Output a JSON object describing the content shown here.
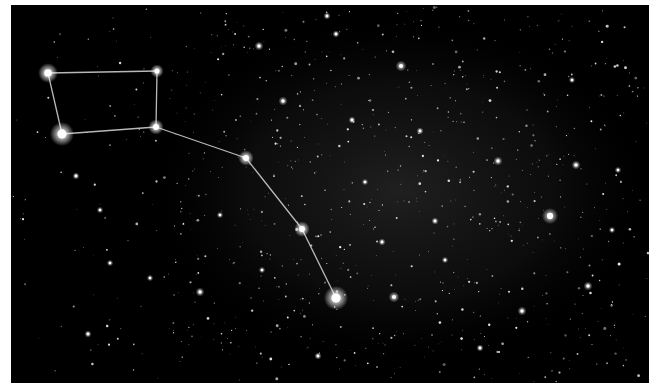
{
  "image": {
    "subject": "Big Dipper constellation star field",
    "background": "#000000",
    "border": "#ffffff",
    "frame": {
      "x": 11,
      "y": 5,
      "w": 638,
      "h": 378
    }
  },
  "constellation": {
    "name": "Big Dipper",
    "line_color": "#d8d8d8",
    "stars": [
      {
        "id": "dubhe",
        "x": 48,
        "y": 73,
        "r": 4.5
      },
      {
        "id": "merak",
        "x": 62,
        "y": 134,
        "r": 5.5
      },
      {
        "id": "phecda",
        "x": 156,
        "y": 127,
        "r": 3.5
      },
      {
        "id": "megrez",
        "x": 157,
        "y": 71,
        "r": 3.0
      },
      {
        "id": "alioth",
        "x": 246,
        "y": 158,
        "r": 3.5
      },
      {
        "id": "mizar",
        "x": 302,
        "y": 229,
        "r": 3.5
      },
      {
        "id": "alkaid",
        "x": 336,
        "y": 298,
        "r": 5.5
      }
    ],
    "lines": [
      [
        "dubhe",
        "megrez"
      ],
      [
        "megrez",
        "phecda"
      ],
      [
        "phecda",
        "merak"
      ],
      [
        "merak",
        "dubhe"
      ],
      [
        "phecda",
        "alioth"
      ],
      [
        "alioth",
        "mizar"
      ],
      [
        "mizar",
        "alkaid"
      ]
    ]
  },
  "bright_stars": [
    {
      "x": 550,
      "y": 216,
      "r": 4.5
    },
    {
      "x": 401,
      "y": 66,
      "r": 3.0
    },
    {
      "x": 259,
      "y": 46,
      "r": 2.5
    },
    {
      "x": 283,
      "y": 101,
      "r": 2.5
    },
    {
      "x": 394,
      "y": 297,
      "r": 3.0
    },
    {
      "x": 576,
      "y": 165,
      "r": 2.5
    },
    {
      "x": 327,
      "y": 16,
      "r": 2.0
    },
    {
      "x": 76,
      "y": 176,
      "r": 2.0
    },
    {
      "x": 200,
      "y": 292,
      "r": 2.5
    },
    {
      "x": 498,
      "y": 161,
      "r": 2.5
    },
    {
      "x": 435,
      "y": 221,
      "r": 2.0
    },
    {
      "x": 382,
      "y": 242,
      "r": 2.0
    },
    {
      "x": 588,
      "y": 286,
      "r": 2.5
    },
    {
      "x": 522,
      "y": 311,
      "r": 2.5
    },
    {
      "x": 480,
      "y": 348,
      "r": 2.0
    },
    {
      "x": 88,
      "y": 334,
      "r": 2.0
    },
    {
      "x": 100,
      "y": 210,
      "r": 1.8
    },
    {
      "x": 110,
      "y": 263,
      "r": 1.8
    },
    {
      "x": 420,
      "y": 131,
      "r": 2.0
    },
    {
      "x": 352,
      "y": 120,
      "r": 2.0
    },
    {
      "x": 220,
      "y": 215,
      "r": 1.8
    },
    {
      "x": 336,
      "y": 34,
      "r": 2.0
    },
    {
      "x": 572,
      "y": 80,
      "r": 1.8
    },
    {
      "x": 618,
      "y": 170,
      "r": 1.8
    },
    {
      "x": 612,
      "y": 230,
      "r": 1.8
    },
    {
      "x": 318,
      "y": 356,
      "r": 2.0
    },
    {
      "x": 150,
      "y": 278,
      "r": 1.8
    },
    {
      "x": 262,
      "y": 270,
      "r": 1.8
    },
    {
      "x": 445,
      "y": 260,
      "r": 1.8
    },
    {
      "x": 365,
      "y": 182,
      "r": 1.8
    }
  ],
  "field": {
    "seed": 7,
    "faint_star_count": 900,
    "glow": {
      "cx": 400,
      "cy": 190,
      "rx": 260,
      "ry": 180,
      "color": "#2a2a2a"
    }
  }
}
